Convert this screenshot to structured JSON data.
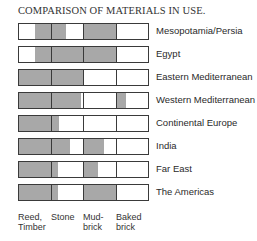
{
  "chart_data": {
    "type": "table",
    "title": "COMPARISON OF MATERIALS IN USE.",
    "categories": [
      "Reed, Timber",
      "Stone",
      "Mud-brick",
      "Baked brick"
    ],
    "category_labels": [
      [
        "Reed,",
        "Timber"
      ],
      [
        "Stone",
        ""
      ],
      [
        "Mud-",
        "brick"
      ],
      [
        "Baked",
        "brick"
      ]
    ],
    "rows": [
      {
        "name": "Mesopotamia/Persia",
        "fills": [
          [
            0.5,
            1.0
          ],
          [
            0.0,
            0.45
          ],
          [
            0.0,
            1.0
          ],
          [
            0,
            0
          ]
        ]
      },
      {
        "name": "Egypt",
        "fills": [
          [
            0.5,
            1.0
          ],
          [
            0.0,
            1.0
          ],
          [
            0.0,
            1.0
          ],
          [
            0,
            0
          ]
        ]
      },
      {
        "name": "Eastern Mediterranean",
        "fills": [
          [
            0.0,
            1.0
          ],
          [
            0.0,
            1.0
          ],
          [
            0,
            0
          ],
          [
            0,
            0
          ]
        ]
      },
      {
        "name": "Western Mediterranean",
        "fills": [
          [
            0.0,
            1.0
          ],
          [
            0.0,
            0.95
          ],
          [
            0,
            0
          ],
          [
            0.0,
            0.3
          ]
        ]
      },
      {
        "name": "Continental Europe",
        "fills": [
          [
            0.0,
            1.0
          ],
          [
            0.0,
            0.25
          ],
          [
            0,
            0
          ],
          [
            0,
            0
          ]
        ]
      },
      {
        "name": "India",
        "fills": [
          [
            0.0,
            1.0
          ],
          [
            0.0,
            0.6
          ],
          [
            0.0,
            0.65
          ],
          [
            0,
            0
          ]
        ]
      },
      {
        "name": "Far East",
        "fills": [
          [
            0.0,
            1.0
          ],
          [
            0.0,
            0.2
          ],
          [
            0.0,
            0.45
          ],
          [
            0,
            0
          ]
        ]
      },
      {
        "name": "The Americas",
        "fills": [
          [
            0.0,
            1.0
          ],
          [
            0.0,
            0.2
          ],
          [
            0.0,
            1.0
          ],
          [
            0,
            0
          ]
        ]
      }
    ],
    "fill_color": "#a8a8a8",
    "grid": false,
    "legend": "none"
  }
}
